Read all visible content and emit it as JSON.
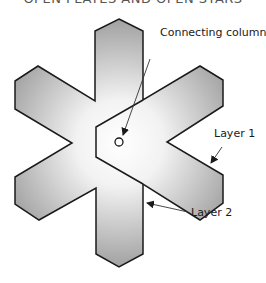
{
  "title": "OPEN PLATES AND OPEN STARS",
  "labels": {
    "connecting_column": "Connecting column",
    "layer1": "Layer 1",
    "layer2": "Layer 2"
  },
  "colors": {
    "stroke": "#1a1a1a",
    "fill_light": "#ffffff",
    "fill_dark": "#a9a9a9"
  }
}
